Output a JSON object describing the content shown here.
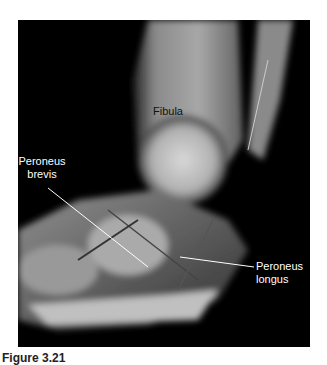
{
  "figure": {
    "labels": {
      "fibula": "Fibula",
      "peroneus_brevis_1": "Peroneus",
      "peroneus_brevis_2": "brevis",
      "peroneus_longus_1": "Peroneus",
      "peroneus_longus_2": "longus"
    },
    "caption": "Figure 3.21"
  }
}
